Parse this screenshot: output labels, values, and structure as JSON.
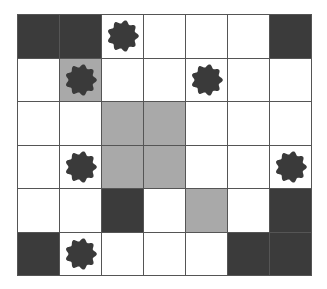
{
  "game": {
    "rows": 6,
    "cols": 7,
    "colors": {
      "dark": "#3b3b3b",
      "gray": "#a9a9a9",
      "white": "#ffffff",
      "piece": "#3a3a3a",
      "gridline": "#555555"
    },
    "cells": [
      [
        {
          "fill": "dark"
        },
        {
          "fill": "dark"
        },
        {
          "fill": "white",
          "piece": "flower-icon"
        },
        {
          "fill": "white"
        },
        {
          "fill": "white"
        },
        {
          "fill": "white"
        },
        {
          "fill": "dark"
        }
      ],
      [
        {
          "fill": "white"
        },
        {
          "fill": "gray",
          "piece": "flower-icon"
        },
        {
          "fill": "white"
        },
        {
          "fill": "white"
        },
        {
          "fill": "white",
          "piece": "flower-icon"
        },
        {
          "fill": "white"
        },
        {
          "fill": "white"
        }
      ],
      [
        {
          "fill": "white"
        },
        {
          "fill": "white"
        },
        {
          "fill": "gray"
        },
        {
          "fill": "gray"
        },
        {
          "fill": "white"
        },
        {
          "fill": "white"
        },
        {
          "fill": "white"
        }
      ],
      [
        {
          "fill": "white"
        },
        {
          "fill": "white",
          "piece": "flower-icon"
        },
        {
          "fill": "gray"
        },
        {
          "fill": "gray"
        },
        {
          "fill": "white"
        },
        {
          "fill": "white"
        },
        {
          "fill": "white",
          "piece": "flower-icon"
        }
      ],
      [
        {
          "fill": "white"
        },
        {
          "fill": "white"
        },
        {
          "fill": "dark"
        },
        {
          "fill": "white"
        },
        {
          "fill": "gray"
        },
        {
          "fill": "white"
        },
        {
          "fill": "dark"
        }
      ],
      [
        {
          "fill": "dark"
        },
        {
          "fill": "white",
          "piece": "flower-icon"
        },
        {
          "fill": "white"
        },
        {
          "fill": "white"
        },
        {
          "fill": "white"
        },
        {
          "fill": "dark"
        },
        {
          "fill": "dark"
        }
      ]
    ]
  }
}
